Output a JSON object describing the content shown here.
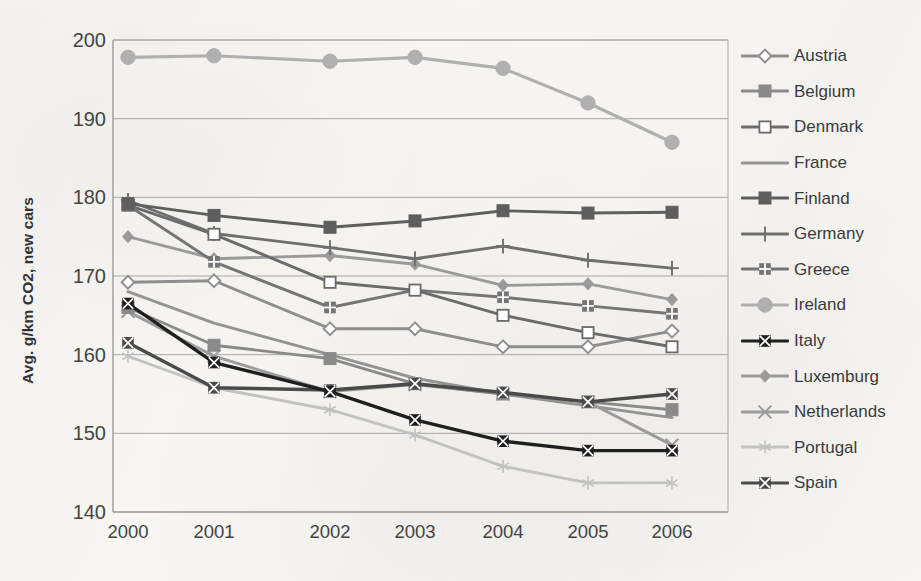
{
  "chart_data": {
    "type": "line",
    "title": "",
    "xlabel": "",
    "ylabel": "Avg. g/km CO2, new cars",
    "categories": [
      "2000",
      "2001",
      "2002",
      "2003",
      "2004",
      "2005",
      "2006"
    ],
    "x": [
      2000,
      2001,
      2002,
      2003,
      2004,
      2005,
      2006
    ],
    "ylim": [
      140,
      200
    ],
    "yticks": [
      140,
      150,
      160,
      170,
      180,
      190,
      200
    ],
    "ytick_labels": [
      "140",
      "150",
      "160",
      "170",
      "180",
      "190",
      "200"
    ],
    "grid": "horizontal",
    "legend_position": "right",
    "series": [
      {
        "name": "Austria",
        "marker": "open-diamond",
        "color": "#8e8e8e",
        "values": [
          169.2,
          169.4,
          163.3,
          163.3,
          161.0,
          161.0,
          163.0
        ]
      },
      {
        "name": "Belgium",
        "marker": "filled-square",
        "color": "#8a8a8a",
        "values": [
          166.0,
          161.2,
          159.5,
          156.3,
          155.0,
          154.0,
          153.0
        ]
      },
      {
        "name": "Denmark",
        "marker": "open-square",
        "color": "#6b6b6b",
        "values": [
          179.0,
          175.3,
          169.2,
          168.2,
          165.0,
          162.8,
          161.0
        ]
      },
      {
        "name": "France",
        "marker": "none",
        "color": "#949494",
        "values": [
          168.0,
          164.0,
          160.0,
          157.0,
          155.0,
          153.5,
          152.0
        ]
      },
      {
        "name": "Finland",
        "marker": "filled-square",
        "color": "#5e5e5e",
        "values": [
          179.2,
          177.7,
          176.2,
          177.0,
          178.3,
          178.0,
          178.1
        ]
      },
      {
        "name": "Germany",
        "marker": "plus",
        "color": "#6f6f6f",
        "values": [
          179.6,
          175.4,
          173.6,
          172.2,
          173.8,
          172.0,
          171.0
        ]
      },
      {
        "name": "Greece",
        "marker": "checker-square",
        "color": "#757575",
        "values": [
          179.0,
          171.8,
          166.0,
          168.2,
          167.3,
          166.2,
          165.2
        ]
      },
      {
        "name": "Ireland",
        "marker": "big-circle",
        "color": "#b0b0b0",
        "values": [
          197.8,
          198.0,
          197.3,
          197.8,
          196.4,
          192.0,
          187.0
        ]
      },
      {
        "name": "Italy",
        "marker": "crossed-square",
        "color": "#1f1f1f",
        "values": [
          166.5,
          159.0,
          155.3,
          151.7,
          149.0,
          147.8,
          147.8
        ]
      },
      {
        "name": "Luxemburg",
        "marker": "small-diamond",
        "color": "#9a9a9a",
        "values": [
          175.0,
          172.2,
          172.6,
          171.5,
          168.8,
          169.0,
          167.0
        ]
      },
      {
        "name": "Netherlands",
        "marker": "x-cross",
        "color": "#9c9c9c",
        "values": [
          165.5,
          159.8,
          155.3,
          156.2,
          155.0,
          154.0,
          148.5
        ]
      },
      {
        "name": "Portugal",
        "marker": "asterisk",
        "color": "#c2c2c2",
        "values": [
          159.8,
          155.8,
          153.0,
          149.8,
          145.8,
          143.7,
          143.7
        ]
      },
      {
        "name": "Spain",
        "marker": "crossed-square",
        "color": "#4a4a4a",
        "values": [
          161.5,
          155.8,
          155.5,
          156.3,
          155.2,
          154.0,
          155.0
        ]
      }
    ]
  },
  "axis": {
    "y_title": "Avg. g/km CO2, new cars"
  }
}
